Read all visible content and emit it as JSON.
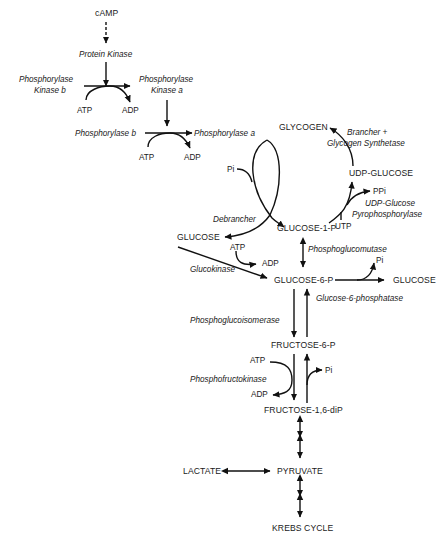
{
  "diagram": {
    "cascade": {
      "camp": "cAMP",
      "protein_kinase": "Protein Kinase",
      "phk_b_line1": "Phosphorylase",
      "phk_b_line2": "Kinase b",
      "phk_a_line1": "Phosphorylase",
      "phk_a_line2": "Kinase a",
      "atp1": "ATP",
      "adp1": "ADP",
      "phos_b": "Phosphorylase b",
      "phos_a": "Phosphorylase a",
      "atp2": "ATP",
      "adp2": "ADP"
    },
    "glycogen_cycle": {
      "glycogen": "GLYCOGEN",
      "pi": "Pi",
      "debrancher": "Debrancher",
      "glucose_free": "GLUCOSE",
      "glucose_1_p": "GLUCOSE-1-P",
      "brancher_line1": "Brancher +",
      "brancher_line2": "Glycogen Synthetase",
      "udp_glucose": "UDP-GLUCOSE",
      "ppi": "PPi",
      "udpg_enz_line1": "UDP-Glucose",
      "udpg_enz_line2": "Pyrophosphorylase",
      "utp": "UTP"
    },
    "glycolysis": {
      "phosphoglucomutase": "Phosphoglucomutase",
      "atp3": "ATP",
      "adp3": "ADP",
      "glucokinase": "Glucokinase",
      "glucose_6_p": "GLUCOSE-6-P",
      "pi2": "Pi",
      "glucose_out": "GLUCOSE",
      "g6pase": "Glucose-6-phosphatase",
      "pgi": "Phosphoglucoisomerase",
      "fructose_6_p": "FRUCTOSE-6-P",
      "atp4": "ATP",
      "pfk": "Phosphofructokinase",
      "adp4": "ADP",
      "pi3": "Pi",
      "fructose_16_dip": "FRUCTOSE-1,6-diP",
      "lactate": "LACTATE",
      "pyruvate": "PYRUVATE",
      "krebs": "KREBS CYCLE"
    }
  }
}
